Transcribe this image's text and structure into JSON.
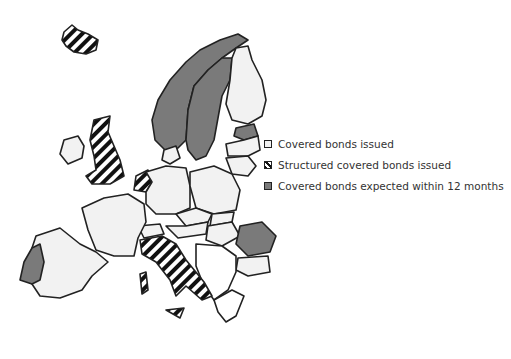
{
  "legend": {
    "items": [
      {
        "label": "Covered bonds issued",
        "category": "light",
        "color": "#f2f2f2"
      },
      {
        "label": "Structured covered bonds issued",
        "category": "striped",
        "color": "#111111"
      },
      {
        "label": "Covered bonds expected within 12 months",
        "category": "dark",
        "color": "#7a7a7a"
      }
    ]
  },
  "map": {
    "countries": {
      "covered_bonds_issued": [
        "Ireland",
        "Spain",
        "France",
        "Germany",
        "Denmark",
        "Finland",
        "Latvia",
        "Lithuania",
        "Poland",
        "Czech Republic",
        "Slovakia",
        "Austria",
        "Hungary",
        "Switzerland",
        "Luxembourg",
        "Belgium",
        "Bulgaria"
      ],
      "structured_covered_bonds_issued": [
        "Iceland",
        "United Kingdom",
        "Netherlands",
        "Italy"
      ],
      "expected_within_12_months": [
        "Portugal",
        "Norway",
        "Sweden",
        "Estonia",
        "Romania"
      ]
    }
  }
}
